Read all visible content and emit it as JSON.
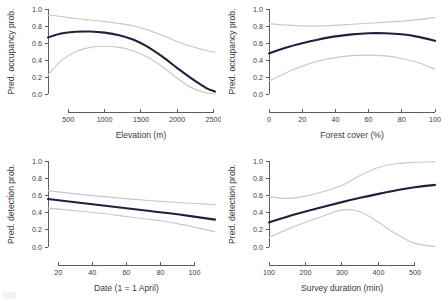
{
  "figure": {
    "background": "#ffffff",
    "fit_color": "#20203c",
    "band_color": "#c8c8c8",
    "axis_color": "#4a4a4a"
  },
  "chart_data": [
    {
      "type": "line",
      "panel": "top-left",
      "title": "",
      "xlabel": "Elevation (m)",
      "ylabel": "Pred. occupancy prob.",
      "xlim": [
        220,
        2520
      ],
      "ylim": [
        0.0,
        1.0
      ],
      "xticks": [
        500,
        1000,
        1500,
        2000,
        2500
      ],
      "yticks": [
        0.0,
        0.2,
        0.4,
        0.6,
        0.8,
        1.0
      ],
      "xtick_labels": [
        "500",
        "1000",
        "1500",
        "2000",
        "2500"
      ],
      "ytick_labels": [
        "0.0",
        "0.2",
        "0.4",
        "0.6",
        "0.8",
        "1.0"
      ],
      "grid": false,
      "legend": "none",
      "x": [
        220,
        400,
        600,
        800,
        1000,
        1200,
        1400,
        1600,
        1800,
        2000,
        2200,
        2400,
        2520
      ],
      "series": [
        {
          "name": "fit",
          "values": [
            0.665,
            0.712,
            0.733,
            0.735,
            0.722,
            0.692,
            0.638,
            0.552,
            0.436,
            0.305,
            0.18,
            0.07,
            0.028
          ]
        },
        {
          "name": "upper_ci",
          "values": [
            0.93,
            0.912,
            0.888,
            0.87,
            0.852,
            0.83,
            0.8,
            0.752,
            0.688,
            0.618,
            0.558,
            0.512,
            0.492
          ]
        },
        {
          "name": "lower_ci",
          "values": [
            0.222,
            0.392,
            0.498,
            0.548,
            0.562,
            0.548,
            0.505,
            0.428,
            0.318,
            0.185,
            0.072,
            0.012,
            0.002
          ]
        }
      ]
    },
    {
      "type": "line",
      "panel": "top-right",
      "title": "",
      "xlabel": "Forest cover (%)",
      "ylabel": "Pred. occupancy prob.",
      "xlim": [
        0,
        100
      ],
      "ylim": [
        0.0,
        1.0
      ],
      "xticks": [
        0,
        20,
        40,
        60,
        80,
        100
      ],
      "yticks": [
        0.0,
        0.2,
        0.4,
        0.6,
        0.8,
        1.0
      ],
      "xtick_labels": [
        "0",
        "20",
        "40",
        "60",
        "80",
        "100"
      ],
      "ytick_labels": [
        "0.0",
        "0.2",
        "0.4",
        "0.6",
        "0.8",
        "1.0"
      ],
      "grid": false,
      "legend": "none",
      "x": [
        0,
        10,
        20,
        30,
        40,
        50,
        60,
        70,
        80,
        90,
        100
      ],
      "series": [
        {
          "name": "fit",
          "values": [
            0.478,
            0.545,
            0.598,
            0.642,
            0.678,
            0.702,
            0.715,
            0.715,
            0.702,
            0.672,
            0.625
          ]
        },
        {
          "name": "upper_ci",
          "values": [
            0.828,
            0.812,
            0.8,
            0.8,
            0.808,
            0.82,
            0.832,
            0.845,
            0.858,
            0.875,
            0.902
          ]
        },
        {
          "name": "lower_ci",
          "values": [
            0.152,
            0.248,
            0.328,
            0.388,
            0.428,
            0.452,
            0.458,
            0.448,
            0.418,
            0.368,
            0.292
          ]
        }
      ]
    },
    {
      "type": "line",
      "panel": "bottom-left",
      "title": "",
      "xlabel": "Date (1 = 1 April)",
      "ylabel": "Pred. detection prob.",
      "xlim": [
        14,
        112
      ],
      "ylim": [
        0.0,
        1.0
      ],
      "xticks": [
        20,
        40,
        60,
        80,
        100
      ],
      "yticks": [
        0.0,
        0.2,
        0.4,
        0.6,
        0.8,
        1.0
      ],
      "xtick_labels": [
        "20",
        "40",
        "60",
        "80",
        "100"
      ],
      "ytick_labels": [
        "0.0",
        "0.2",
        "0.4",
        "0.6",
        "0.8",
        "1.0"
      ],
      "grid": false,
      "legend": "none",
      "x": [
        14,
        30,
        45,
        60,
        75,
        90,
        112
      ],
      "series": [
        {
          "name": "fit",
          "values": [
            0.558,
            0.52,
            0.485,
            0.45,
            0.415,
            0.38,
            0.318
          ]
        },
        {
          "name": "upper_ci",
          "values": [
            0.655,
            0.618,
            0.588,
            0.562,
            0.538,
            0.518,
            0.492
          ]
        },
        {
          "name": "lower_ci",
          "values": [
            0.452,
            0.422,
            0.392,
            0.355,
            0.318,
            0.272,
            0.178
          ]
        }
      ]
    },
    {
      "type": "line",
      "panel": "bottom-right",
      "title": "",
      "xlabel": "Survey duration (min)",
      "ylabel": "Pred. detection prob.",
      "xlim": [
        100,
        555
      ],
      "ylim": [
        0.0,
        1.0
      ],
      "xticks": [
        100,
        200,
        300,
        400,
        500
      ],
      "yticks": [
        0.0,
        0.2,
        0.4,
        0.6,
        0.8,
        1.0
      ],
      "xtick_labels": [
        "100",
        "200",
        "300",
        "400",
        "500"
      ],
      "ytick_labels": [
        "0.0",
        "0.2",
        "0.4",
        "0.6",
        "0.8",
        "1.0"
      ],
      "grid": false,
      "legend": "none",
      "x": [
        100,
        150,
        200,
        250,
        300,
        350,
        400,
        450,
        500,
        555
      ],
      "series": [
        {
          "name": "fit",
          "values": [
            0.285,
            0.352,
            0.412,
            0.468,
            0.522,
            0.572,
            0.618,
            0.66,
            0.695,
            0.722
          ]
        },
        {
          "name": "upper_ci",
          "values": [
            0.585,
            0.565,
            0.592,
            0.645,
            0.718,
            0.832,
            0.925,
            0.968,
            0.985,
            0.992
          ]
        },
        {
          "name": "lower_ci",
          "values": [
            0.112,
            0.205,
            0.288,
            0.362,
            0.432,
            0.41,
            0.288,
            0.148,
            0.042,
            0.005
          ]
        }
      ]
    }
  ]
}
